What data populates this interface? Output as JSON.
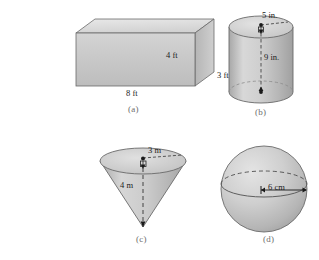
{
  "figure": {
    "title": "",
    "background_color": "#ffffff",
    "solid_fill_light": "#dcdcdc",
    "solid_fill_mid": "#c4c4c4",
    "solid_fill_dark": "#a9a9a9",
    "outline_color": "#555555",
    "label_color": "#1a1a1a",
    "caption_color": "#6d6d6d"
  },
  "panels": [
    {
      "id": "a",
      "caption": "(a)",
      "shape": "rectangular-prism",
      "shape_name": "rectangular prism",
      "dimensions": [
        {
          "name": "width",
          "value": "8 ft",
          "position": "bottom-front-edge"
        },
        {
          "name": "height",
          "value": "4 ft",
          "position": "right-front-face"
        },
        {
          "name": "depth",
          "value": "3 ft",
          "position": "lower-right-side"
        }
      ]
    },
    {
      "id": "b",
      "caption": "(b)",
      "shape": "cylinder",
      "shape_name": "cylinder",
      "dimensions": [
        {
          "name": "radius",
          "value": "5 in.",
          "position": "top-face-radius"
        },
        {
          "name": "height",
          "value": "9 in.",
          "position": "central-axis"
        }
      ]
    },
    {
      "id": "c",
      "caption": "(c)",
      "shape": "cone-inverted",
      "shape_name": "inverted cone",
      "dimensions": [
        {
          "name": "radius",
          "value": "3 m",
          "position": "top-face-radius"
        },
        {
          "name": "height",
          "value": "4 m",
          "position": "central-axis"
        }
      ]
    },
    {
      "id": "d",
      "caption": "(d)",
      "shape": "sphere",
      "shape_name": "sphere",
      "dimensions": [
        {
          "name": "radius",
          "value": "6 cm",
          "position": "equator-radius"
        }
      ]
    }
  ]
}
